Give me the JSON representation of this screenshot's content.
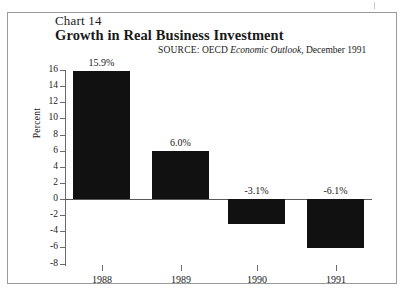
{
  "frame": {
    "artifact_name": "scan-artifact-mark"
  },
  "header": {
    "chart_number": "Chart 14",
    "title": "Growth in Real Business Investment",
    "source_label": "SOURCE:",
    "source_org": "OECD",
    "source_publication": "Economic Outlook",
    "source_date": ", December 1991"
  },
  "chart_data": {
    "type": "bar",
    "title": "Growth in Real Business Investment",
    "subtitle": "Chart 14",
    "xlabel": "",
    "ylabel": "Percent",
    "categories": [
      "1988",
      "1989",
      "1990",
      "1991"
    ],
    "values": [
      15.9,
      6.0,
      -3.1,
      -6.1
    ],
    "data_labels": [
      "15.9%",
      "6.0%",
      "-3.1%",
      "-6.1%"
    ],
    "ylim": [
      -8,
      16
    ],
    "ytick_values": [
      16,
      14,
      12,
      10,
      8,
      6,
      4,
      2,
      0,
      -2,
      -4,
      -6,
      -8
    ],
    "ytick_labels": [
      "16",
      "14",
      "12",
      "10",
      "8",
      "6",
      "4",
      "2",
      "0",
      "-2",
      "-4",
      "-6",
      "-8"
    ],
    "grid": false,
    "legend": null,
    "bar_color": "#111111",
    "axis_color": "#6b6b6b",
    "zero_line_color": "#585858"
  }
}
